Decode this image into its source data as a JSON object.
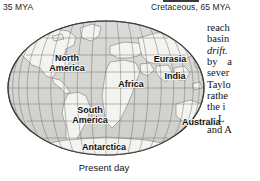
{
  "header": {
    "left_label": "35 MYA",
    "right_label": "Cretaceous, 65 MYA"
  },
  "figure": {
    "caption": "Present day",
    "map_labels": {
      "north_america": "North\nAmerica",
      "north_america_line1": "North",
      "north_america_line2": "America",
      "south_america_line1": "South",
      "south_america_line2": "America",
      "africa": "Africa",
      "eurasia": "Eurasia",
      "india": "India",
      "australia": "Australia",
      "antarctica": "Antarctica"
    },
    "projection": "elliptical world map with graticule",
    "colors": {
      "ocean": "#d8d8d6",
      "land": "#f2f2ef",
      "coastline": "#8a8a88",
      "graticule": "#6e6e6c",
      "outline": "#3c3c3a"
    }
  },
  "body_text": {
    "lines": [
      {
        "text": "reach",
        "style": "normal"
      },
      {
        "text": "basin",
        "style": "normal"
      },
      {
        "text": "drift.",
        "style": "italic"
      },
      {
        "text": "by a",
        "style": "wide-gap"
      },
      {
        "text": "sever",
        "style": "normal"
      },
      {
        "text": "Taylo",
        "style": "normal"
      },
      {
        "text": "rathe",
        "style": "normal"
      },
      {
        "text": "the i",
        "style": "normal"
      },
      {
        "text": "L",
        "style": "indent"
      },
      {
        "text": "and A",
        "style": "normal"
      }
    ]
  }
}
